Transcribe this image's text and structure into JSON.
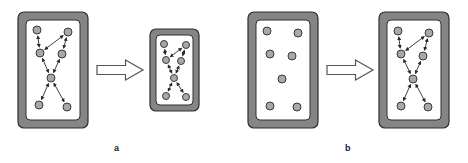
{
  "figure": {
    "labels": {
      "a": "a",
      "b": "b"
    },
    "colors": {
      "frame_fill": "#858585",
      "frame_stroke": "#2e2e2e",
      "inner_fill": "#ffffff",
      "node_fill": "#a8a8a8",
      "node_stroke": "#3a3a3a",
      "edge": "#2a2a2a",
      "arrow_fill": "#ffffff",
      "arrow_stroke": "#555555"
    },
    "panels": [
      {
        "id": "a-before",
        "outer": [
          18,
          12,
          70,
          116
        ],
        "inner": [
          26,
          20,
          54,
          100
        ],
        "node_r": 4,
        "nodes": [
          [
            37,
            30
          ],
          [
            68,
            32
          ],
          [
            40,
            53
          ],
          [
            62,
            54
          ],
          [
            51,
            78
          ],
          [
            39,
            105
          ],
          [
            67,
            107
          ]
        ],
        "edges": [
          [
            0,
            2
          ],
          [
            1,
            3
          ],
          [
            2,
            1
          ],
          [
            2,
            4
          ],
          [
            3,
            4
          ],
          [
            4,
            5
          ],
          [
            4,
            6
          ]
        ]
      },
      {
        "id": "a-after",
        "outer": [
          150,
          29,
          49,
          82
        ],
        "inner": [
          156,
          35,
          37,
          70
        ],
        "node_r": 3.5,
        "nodes": [
          [
            164,
            44
          ],
          [
            186,
            45
          ],
          [
            166,
            60
          ],
          [
            181,
            61
          ],
          [
            174,
            78
          ],
          [
            166,
            96
          ],
          [
            186,
            97
          ]
        ],
        "edges": [
          [
            0,
            2
          ],
          [
            1,
            3
          ],
          [
            2,
            1
          ],
          [
            2,
            4
          ],
          [
            3,
            4
          ],
          [
            4,
            5
          ],
          [
            4,
            6
          ]
        ]
      },
      {
        "id": "b-before",
        "outer": [
          248,
          12,
          70,
          116
        ],
        "inner": [
          256,
          20,
          54,
          100
        ],
        "node_r": 4,
        "nodes": [
          [
            267,
            31
          ],
          [
            298,
            33
          ],
          [
            270,
            54
          ],
          [
            292,
            56
          ],
          [
            282,
            79
          ],
          [
            270,
            106
          ],
          [
            297,
            107
          ]
        ],
        "edges": []
      },
      {
        "id": "b-after",
        "outer": [
          379,
          12,
          70,
          116
        ],
        "inner": [
          387,
          20,
          54,
          100
        ],
        "node_r": 4,
        "nodes": [
          [
            398,
            31
          ],
          [
            429,
            33
          ],
          [
            401,
            54
          ],
          [
            423,
            56
          ],
          [
            413,
            79
          ],
          [
            401,
            106
          ],
          [
            428,
            107
          ]
        ],
        "edges": [
          [
            0,
            2
          ],
          [
            1,
            3
          ],
          [
            2,
            1
          ],
          [
            2,
            4
          ],
          [
            3,
            4
          ],
          [
            4,
            5
          ],
          [
            4,
            6
          ]
        ]
      }
    ],
    "arrows": [
      {
        "id": "arrow-a",
        "x": 97,
        "y": 70,
        "len": 46
      },
      {
        "id": "arrow-b",
        "x": 327,
        "y": 70,
        "len": 46
      }
    ]
  }
}
